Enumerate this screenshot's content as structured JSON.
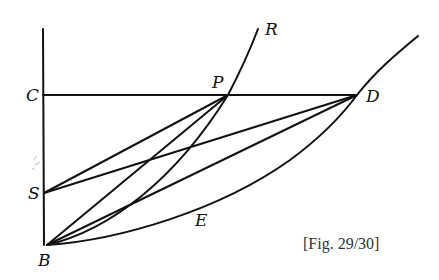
{
  "figure": {
    "caption": "[Fig. 29/30]",
    "stroke_color": "#111111",
    "points": {
      "C": {
        "label": "C",
        "x": 43,
        "y": 95
      },
      "P": {
        "label": "P",
        "x": 228,
        "y": 95
      },
      "D": {
        "label": "D",
        "x": 357,
        "y": 95
      },
      "R": {
        "label": "R",
        "x": 258,
        "y": 29
      },
      "S": {
        "label": "S",
        "x": 43,
        "y": 193
      },
      "B": {
        "label": "B",
        "x": 47,
        "y": 245
      },
      "E": {
        "label": "E",
        "x": 200,
        "y": 215
      }
    },
    "segments": [
      {
        "name": "axis",
        "from": "top",
        "to": "B"
      },
      {
        "name": "CD",
        "from": "C",
        "to": "D"
      },
      {
        "name": "SP",
        "from": "S",
        "to": "P"
      },
      {
        "name": "SD",
        "from": "S",
        "to": "D"
      },
      {
        "name": "BP",
        "from": "B",
        "to": "P"
      },
      {
        "name": "BD",
        "from": "B",
        "to": "D"
      }
    ],
    "curves": [
      {
        "name": "curve-BPR",
        "through": [
          "B",
          "P",
          "R"
        ]
      },
      {
        "name": "curve-BED",
        "through": [
          "B",
          "E",
          "D"
        ]
      }
    ]
  }
}
